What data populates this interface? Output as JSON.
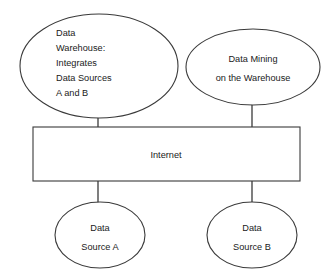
{
  "diagram": {
    "background_color": "#ffffff",
    "stroke_color": "#3a3a3a",
    "text_color": "#1a1a1a",
    "nodes": {
      "data_warehouse": {
        "shape": "ellipse",
        "text_align": "left",
        "lines": [
          "Data",
          "Warehouse:",
          "Integrates",
          "Data Sources",
          "A and B"
        ]
      },
      "data_mining": {
        "shape": "ellipse",
        "text_align": "center",
        "lines": [
          "Data Mining",
          "on the Warehouse"
        ]
      },
      "internet": {
        "shape": "rectangle",
        "text_align": "center",
        "lines": [
          "Internet"
        ]
      },
      "data_source_a": {
        "shape": "ellipse",
        "text_align": "center",
        "lines": [
          "Data",
          "Source A"
        ]
      },
      "data_source_b": {
        "shape": "ellipse",
        "text_align": "center",
        "lines": [
          "Data",
          "Source B"
        ]
      }
    },
    "edges": [
      {
        "from": "data_warehouse",
        "to": "internet"
      },
      {
        "from": "data_mining",
        "to": "internet"
      },
      {
        "from": "internet",
        "to": "data_source_a"
      },
      {
        "from": "internet",
        "to": "data_source_b"
      }
    ]
  }
}
